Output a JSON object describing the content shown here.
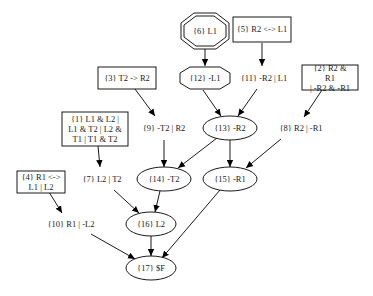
{
  "diagram": {
    "type": "proof-graph",
    "nodes": [
      {
        "id": "n6",
        "label": "{6} L1",
        "shape": "double-octagon",
        "x": 205,
        "y": 31
      },
      {
        "id": "n5",
        "label": "{5} R2 <-> L1",
        "shape": "box",
        "x": 262,
        "y": 29
      },
      {
        "id": "n3",
        "label": "{3} T2 -> R2",
        "shape": "box",
        "x": 127,
        "y": 77
      },
      {
        "id": "n12",
        "label": "{12} -L1",
        "shape": "octagon",
        "x": 205,
        "y": 78
      },
      {
        "id": "n11",
        "label": "{11} -R2 | L1",
        "shape": "plain",
        "x": 264,
        "y": 78
      },
      {
        "id": "n2",
        "label": "{2} R2 & R1\n| -R2 & -R1",
        "shape": "box",
        "x": 330,
        "y": 78
      },
      {
        "id": "n1",
        "label": "{1} L1 & L2 |\nL1 & T2 | L2 &\nT1 | T1 & T2",
        "shape": "box",
        "x": 95,
        "y": 130
      },
      {
        "id": "n9",
        "label": "{9} -T2 | R2",
        "shape": "plain",
        "x": 164,
        "y": 128
      },
      {
        "id": "n13",
        "label": "{13} -R2",
        "shape": "ellipse",
        "x": 230,
        "y": 128
      },
      {
        "id": "n8",
        "label": "{8} R2 | -R1",
        "shape": "plain",
        "x": 301,
        "y": 128
      },
      {
        "id": "n4",
        "label": "{4} R1 <->\nL1 | L2",
        "shape": "box",
        "x": 41,
        "y": 183
      },
      {
        "id": "n7",
        "label": "{7} L2 | T2",
        "shape": "plain",
        "x": 102,
        "y": 179
      },
      {
        "id": "n14",
        "label": "{14} -T2",
        "shape": "ellipse",
        "x": 164,
        "y": 179
      },
      {
        "id": "n15",
        "label": "{15} -R1",
        "shape": "ellipse",
        "x": 230,
        "y": 179
      },
      {
        "id": "n10",
        "label": "{10} R1 | -L2",
        "shape": "plain",
        "x": 71,
        "y": 224
      },
      {
        "id": "n16",
        "label": "{16} L2",
        "shape": "ellipse",
        "x": 151,
        "y": 224
      },
      {
        "id": "n17",
        "label": "{17} $F",
        "shape": "ellipse",
        "x": 151,
        "y": 268
      }
    ],
    "edges": [
      {
        "from": "n6",
        "to": "n12"
      },
      {
        "from": "n5",
        "to": "n11"
      },
      {
        "from": "n3",
        "to": "n9"
      },
      {
        "from": "n12",
        "to": "n13"
      },
      {
        "from": "n11",
        "to": "n13"
      },
      {
        "from": "n2",
        "to": "n8"
      },
      {
        "from": "n1",
        "to": "n7"
      },
      {
        "from": "n9",
        "to": "n14"
      },
      {
        "from": "n13",
        "to": "n14"
      },
      {
        "from": "n13",
        "to": "n15"
      },
      {
        "from": "n8",
        "to": "n15"
      },
      {
        "from": "n4",
        "to": "n10"
      },
      {
        "from": "n7",
        "to": "n16"
      },
      {
        "from": "n14",
        "to": "n16"
      },
      {
        "from": "n10",
        "to": "n17"
      },
      {
        "from": "n16",
        "to": "n17"
      },
      {
        "from": "n15",
        "to": "n17"
      }
    ],
    "colors": {
      "stroke": "#000000",
      "text": "#222222",
      "background": "#ffffff"
    }
  }
}
